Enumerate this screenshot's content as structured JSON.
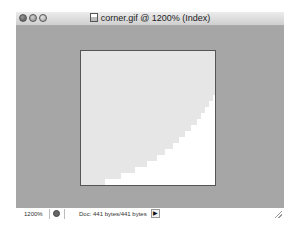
{
  "window": {
    "title": "corner.gif @ 1200% (Index)",
    "traffic_lights": [
      "close",
      "minimize",
      "zoom"
    ]
  },
  "canvas": {
    "fill_color": "#e6e6e6",
    "background_color": "#ffffff",
    "border_color": "#555555",
    "workspace_color": "#a6a6a6"
  },
  "statusbar": {
    "zoom_level": "1200%",
    "doc_info": "Doc: 441 bytes/441 bytes",
    "menu_arrow": "▶"
  }
}
